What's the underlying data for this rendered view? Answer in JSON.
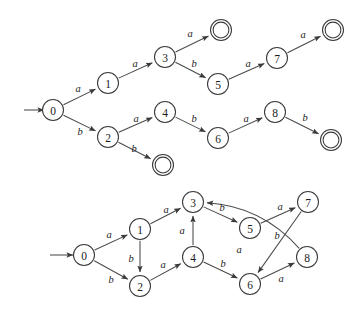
{
  "figure": {
    "background_color": "#ffffff",
    "stroke_color": "#4a4a4a",
    "text_color": "#1c1c1c",
    "width": 362,
    "height": 309
  },
  "diagrams": [
    {
      "id": "nfa-tree",
      "name": "upper-automaton",
      "start_state": "0",
      "start_arrow": {
        "from_x": 24,
        "from_y": 110,
        "to_x": 44,
        "to_y": 110
      },
      "states": [
        {
          "id": "s0",
          "label": "0",
          "x": 53,
          "y": 110,
          "r": 10.5,
          "accepting": false
        },
        {
          "id": "s1",
          "label": "1",
          "x": 108,
          "y": 83,
          "r": 10.5,
          "accepting": false
        },
        {
          "id": "s2",
          "label": "2",
          "x": 108,
          "y": 137,
          "r": 10.5,
          "accepting": false
        },
        {
          "id": "s3",
          "label": "3",
          "x": 165,
          "y": 57,
          "r": 10.5,
          "accepting": false
        },
        {
          "id": "s4",
          "label": "4",
          "x": 165,
          "y": 112,
          "r": 10.5,
          "accepting": false
        },
        {
          "id": "s5",
          "label": "5",
          "x": 218,
          "y": 84,
          "r": 10.5,
          "accepting": false
        },
        {
          "id": "s6",
          "label": "6",
          "x": 218,
          "y": 138,
          "r": 10.5,
          "accepting": false
        },
        {
          "id": "s7",
          "label": "7",
          "x": 277,
          "y": 58,
          "r": 10.5,
          "accepting": false
        },
        {
          "id": "s8",
          "label": "8",
          "x": 275,
          "y": 112,
          "r": 10.5,
          "accepting": false
        },
        {
          "id": "f1",
          "label": "",
          "x": 221,
          "y": 30,
          "r": 10.5,
          "accepting": true
        },
        {
          "id": "f2",
          "label": "",
          "x": 333,
          "y": 30,
          "r": 10.5,
          "accepting": true
        },
        {
          "id": "f3",
          "label": "",
          "x": 163,
          "y": 165,
          "r": 10.5,
          "accepting": true
        },
        {
          "id": "f4",
          "label": "",
          "x": 331,
          "y": 140,
          "r": 10.5,
          "accepting": true
        }
      ],
      "transitions": [
        {
          "from": "s0",
          "to": "s1",
          "symbol": "a",
          "lx": 78,
          "ly": 88
        },
        {
          "from": "s0",
          "to": "s2",
          "symbol": "b",
          "lx": 80,
          "ly": 131
        },
        {
          "from": "s1",
          "to": "s3",
          "symbol": "a",
          "lx": 135,
          "ly": 63
        },
        {
          "from": "s3",
          "to": "f1",
          "symbol": "a",
          "lx": 190,
          "ly": 33
        },
        {
          "from": "s3",
          "to": "s5",
          "symbol": "b",
          "lx": 194,
          "ly": 63
        },
        {
          "from": "s5",
          "to": "s7",
          "symbol": "a",
          "lx": 248,
          "ly": 63
        },
        {
          "from": "s7",
          "to": "f2",
          "symbol": "a",
          "lx": 303,
          "ly": 34
        },
        {
          "from": "s2",
          "to": "s4",
          "symbol": "a",
          "lx": 136,
          "ly": 118
        },
        {
          "from": "s2",
          "to": "f3",
          "symbol": "b",
          "lx": 134,
          "ly": 148
        },
        {
          "from": "s4",
          "to": "s6",
          "symbol": "b",
          "lx": 194,
          "ly": 118
        },
        {
          "from": "s6",
          "to": "s8",
          "symbol": "a",
          "lx": 246,
          "ly": 118
        },
        {
          "from": "s8",
          "to": "f4",
          "symbol": "b",
          "lx": 305,
          "ly": 117
        }
      ]
    },
    {
      "id": "dfa-merged",
      "name": "lower-automaton",
      "start_state": "0",
      "start_arrow": {
        "from_x": 50,
        "from_y": 255,
        "to_x": 73,
        "to_y": 255
      },
      "states": [
        {
          "id": "t0",
          "label": "0",
          "x": 84,
          "y": 255,
          "r": 10.5,
          "accepting": false
        },
        {
          "id": "t1",
          "label": "1",
          "x": 140,
          "y": 229,
          "r": 10.5,
          "accepting": false
        },
        {
          "id": "t2",
          "label": "2",
          "x": 140,
          "y": 286,
          "r": 10.5,
          "accepting": false
        },
        {
          "id": "t3",
          "label": "3",
          "x": 193,
          "y": 202,
          "r": 10.5,
          "accepting": false
        },
        {
          "id": "t4",
          "label": "4",
          "x": 193,
          "y": 257,
          "r": 10.5,
          "accepting": false
        },
        {
          "id": "t5",
          "label": "5",
          "x": 250,
          "y": 228,
          "r": 10.5,
          "accepting": false
        },
        {
          "id": "t6",
          "label": "6",
          "x": 250,
          "y": 284,
          "r": 10.5,
          "accepting": false
        },
        {
          "id": "t7",
          "label": "7",
          "x": 308,
          "y": 202,
          "r": 10.5,
          "accepting": false
        },
        {
          "id": "t8",
          "label": "8",
          "x": 307,
          "y": 257,
          "r": 10.5,
          "accepting": false
        }
      ],
      "transitions": [
        {
          "from": "t0",
          "to": "t1",
          "symbol": "a",
          "lx": 109,
          "ly": 234
        },
        {
          "from": "t0",
          "to": "t2",
          "symbol": "b",
          "lx": 111,
          "ly": 279
        },
        {
          "from": "t1",
          "to": "t3",
          "symbol": "a",
          "lx": 166,
          "ly": 209
        },
        {
          "from": "t1",
          "to": "t2",
          "symbol": "b",
          "lx": 131,
          "ly": 258
        },
        {
          "from": "t2",
          "to": "t4",
          "symbol": "a",
          "lx": 163,
          "ly": 264
        },
        {
          "from": "t4",
          "to": "t3",
          "symbol": "a",
          "lx": 182,
          "ly": 230
        },
        {
          "from": "t3",
          "to": "t5",
          "symbol": "b",
          "lx": 222,
          "ly": 207
        },
        {
          "from": "t4",
          "to": "t6",
          "symbol": "b",
          "lx": 223,
          "ly": 263
        },
        {
          "from": "t5",
          "to": "t7",
          "symbol": "a",
          "lx": 280,
          "ly": 206
        },
        {
          "from": "t7",
          "to": "t6",
          "symbol": "b",
          "lx": 277,
          "ly": 235
        },
        {
          "from": "t6",
          "to": "t8",
          "symbol": "a",
          "lx": 281,
          "ly": 278
        },
        {
          "from": "t8",
          "to": "t3",
          "symbol": "a",
          "lx": 239,
          "ly": 249,
          "curved": true
        }
      ]
    }
  ]
}
